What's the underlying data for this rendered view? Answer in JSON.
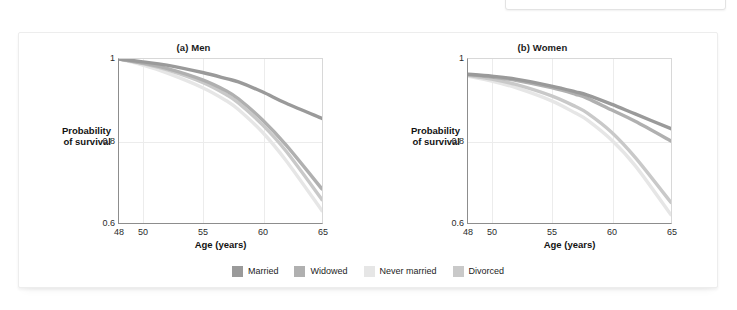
{
  "citation": {
    "text": "Wade, 1995)"
  },
  "figure": {
    "axis_label_y": "Probability\nof survival",
    "axis_label_y_line1": "Probability",
    "axis_label_y_line2": "of survival",
    "axis_label_x": "Age (years)"
  },
  "legend": {
    "items": [
      {
        "label": "Married",
        "color": "#9a9a9a"
      },
      {
        "label": "Widowed",
        "color": "#b0b0b0"
      },
      {
        "label": "Never married",
        "color": "#e6e6e6"
      },
      {
        "label": "Divorced",
        "color": "#c9c9c9"
      }
    ]
  },
  "chart_data": [
    {
      "type": "line",
      "title": "(a) Men",
      "xlabel": "Age (years)",
      "ylabel": "Probability of survival",
      "xlim": [
        48,
        65
      ],
      "ylim": [
        0.6,
        1.0
      ],
      "xticks": [
        48,
        50,
        55,
        60,
        65
      ],
      "xticklabels": [
        "48",
        "50",
        "55",
        "60",
        "65"
      ],
      "yticks": [
        0.6,
        0.8,
        1.0
      ],
      "yticklabels": [
        "0.6",
        "0.8",
        "1"
      ],
      "grid": true,
      "legend_position": "bottom",
      "x": [
        48,
        50,
        52,
        55,
        57,
        58,
        60,
        62,
        65
      ],
      "series": [
        {
          "name": "Married",
          "color": "#9a9a9a",
          "values": [
            1.0,
            0.993,
            0.985,
            0.967,
            0.952,
            0.944,
            0.92,
            0.892,
            0.855
          ]
        },
        {
          "name": "Widowed",
          "color": "#b0b0b0",
          "values": [
            1.0,
            0.99,
            0.977,
            0.949,
            0.922,
            0.903,
            0.852,
            0.79,
            0.683
          ]
        },
        {
          "name": "Divorced",
          "color": "#c9c9c9",
          "values": [
            1.0,
            0.989,
            0.974,
            0.943,
            0.913,
            0.893,
            0.84,
            0.775,
            0.657
          ]
        },
        {
          "name": "Never married",
          "color": "#e6e6e6",
          "values": [
            1.0,
            0.985,
            0.966,
            0.93,
            0.898,
            0.877,
            0.822,
            0.752,
            0.63
          ]
        }
      ]
    },
    {
      "type": "line",
      "title": "(b) Women",
      "xlabel": "Age (years)",
      "ylabel": "Probability of survival",
      "xlim": [
        48,
        65
      ],
      "ylim": [
        0.6,
        1.0
      ],
      "xticks": [
        48,
        50,
        55,
        60,
        65
      ],
      "xticklabels": [
        "48",
        "50",
        "55",
        "60",
        "65"
      ],
      "yticks": [
        0.6,
        0.8,
        1.0
      ],
      "yticklabels": [
        "0.6",
        "0.8",
        "1"
      ],
      "grid": true,
      "legend_position": "bottom",
      "x": [
        48,
        50,
        52,
        55,
        57,
        58,
        60,
        62,
        65
      ],
      "series": [
        {
          "name": "Married",
          "color": "#9a9a9a",
          "values": [
            0.963,
            0.958,
            0.951,
            0.934,
            0.92,
            0.912,
            0.89,
            0.866,
            0.83
          ]
        },
        {
          "name": "Widowed",
          "color": "#b0b0b0",
          "values": [
            0.962,
            0.956,
            0.948,
            0.93,
            0.914,
            0.904,
            0.876,
            0.848,
            0.8
          ]
        },
        {
          "name": "Divorced",
          "color": "#c9c9c9",
          "values": [
            0.96,
            0.951,
            0.938,
            0.91,
            0.884,
            0.868,
            0.822,
            0.76,
            0.65
          ]
        },
        {
          "name": "Never married",
          "color": "#e6e6e6",
          "values": [
            0.958,
            0.946,
            0.93,
            0.898,
            0.868,
            0.851,
            0.803,
            0.74,
            0.62
          ]
        }
      ]
    }
  ]
}
